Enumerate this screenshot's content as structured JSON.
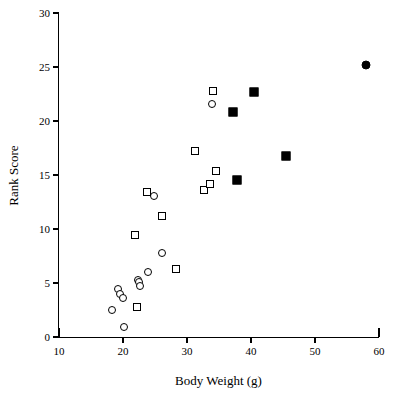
{
  "chart_data": {
    "type": "scatter",
    "title": "",
    "xlabel": "Body Weight (g)",
    "ylabel": "Rank Score",
    "xlim": [
      10,
      60
    ],
    "ylim": [
      0,
      30
    ],
    "xticks": [
      10,
      20,
      30,
      40,
      50,
      60
    ],
    "yticks": [
      0,
      5,
      10,
      15,
      20,
      25,
      30
    ],
    "grid": false,
    "legend": "none",
    "series": [
      {
        "name": "open-circle",
        "marker": "open-circle",
        "points": [
          [
            18.3,
            2.5
          ],
          [
            19.2,
            4.4
          ],
          [
            19.6,
            4.0
          ],
          [
            20.0,
            3.6
          ],
          [
            20.2,
            0.9
          ],
          [
            22.3,
            5.3
          ],
          [
            22.5,
            5.1
          ],
          [
            22.6,
            4.7
          ],
          [
            23.9,
            6.0
          ],
          [
            24.9,
            13.1
          ],
          [
            26.1,
            7.8
          ],
          [
            33.9,
            21.6
          ]
        ]
      },
      {
        "name": "open-square",
        "marker": "open-square",
        "points": [
          [
            21.9,
            9.4
          ],
          [
            22.2,
            2.8
          ],
          [
            23.8,
            13.4
          ],
          [
            26.1,
            11.2
          ],
          [
            28.3,
            6.3
          ],
          [
            31.2,
            17.2
          ],
          [
            32.6,
            13.6
          ],
          [
            33.6,
            14.2
          ],
          [
            34.5,
            15.4
          ],
          [
            34.0,
            22.8
          ]
        ]
      },
      {
        "name": "filled-square",
        "marker": "filled-square",
        "points": [
          [
            37.2,
            20.8
          ],
          [
            37.8,
            14.5
          ],
          [
            40.5,
            22.7
          ],
          [
            45.4,
            16.8
          ]
        ]
      },
      {
        "name": "filled-circle",
        "marker": "filled-circle",
        "points": [
          [
            58.0,
            25.2
          ]
        ]
      }
    ]
  },
  "colors": {
    "axis": "#000000",
    "marker_stroke": "#000000",
    "marker_fill_open": "#ffffff",
    "marker_fill_closed": "#000000",
    "background": "#ffffff"
  }
}
